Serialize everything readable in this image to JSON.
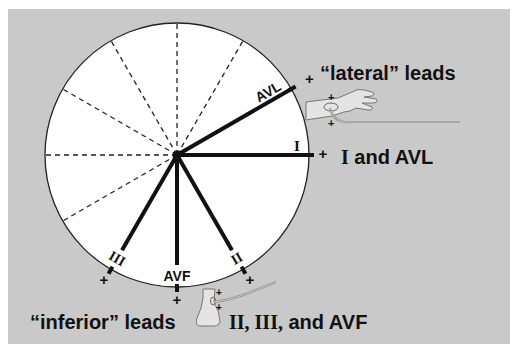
{
  "figure": {
    "background": {
      "x": 8,
      "y": 9,
      "width": 502,
      "height": 335,
      "color": "#c9c9c9"
    },
    "circle": {
      "cx": 177,
      "cy": 155,
      "r": 132,
      "fill": "#ffffff",
      "stroke": "#222222"
    },
    "dashed_axes_deg": [
      -60,
      -90,
      -120,
      -150,
      180,
      150
    ],
    "leads": [
      {
        "name": "I",
        "angle_deg": 0,
        "label": "I",
        "label_font": "serif",
        "plus": "+"
      },
      {
        "name": "AVL",
        "angle_deg": -30,
        "label": "AVL",
        "label_font": "sans",
        "plus": "+"
      },
      {
        "name": "II",
        "angle_deg": 60,
        "label": "II",
        "label_font": "serif",
        "plus": "+"
      },
      {
        "name": "AVF",
        "angle_deg": 90,
        "label": "AVF",
        "label_font": "sans",
        "plus": "+"
      },
      {
        "name": "III",
        "angle_deg": 120,
        "label": "III",
        "label_font": "serif",
        "plus": "+"
      }
    ],
    "annotations": {
      "lateral_title": "“lateral” leads",
      "lateral_leads_serif": "I",
      "lateral_leads_rest": " and AVL",
      "inferior_title": "“inferior” leads",
      "inferior_leads_serif": "II, III,",
      "inferior_leads_rest": " and AVF",
      "arm_plus_top": "+",
      "arm_plus_bottom": "+",
      "leg_plus_top": "+",
      "leg_plus_bottom": "+"
    },
    "icons": {
      "arm": "arm-with-electrode-icon",
      "leg": "leg-with-electrode-icon"
    }
  }
}
